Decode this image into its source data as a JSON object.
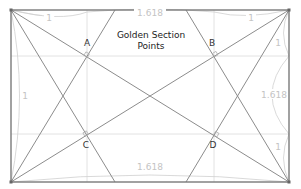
{
  "diagram": {
    "title_line1": "Golden Section",
    "title_line2": "Points",
    "points": [
      {
        "label": "A",
        "x": 87,
        "y": 56
      },
      {
        "label": "B",
        "x": 214,
        "y": 56
      },
      {
        "label": "C",
        "x": 87,
        "y": 134
      },
      {
        "label": "D",
        "x": 214,
        "y": 134
      }
    ],
    "dimension_labels": {
      "top_left": "1",
      "top_center": "1.618",
      "top_right": "1",
      "left": "1",
      "right_upper": "1",
      "right": "1.618",
      "right_lower": "1",
      "bottom_center": "1.618"
    },
    "colors": {
      "frame": "#7a7a7a",
      "construction_lines": "#8c8c8c",
      "grid": "#e2e2e2",
      "dimension_text": "#c4c4c4"
    }
  }
}
